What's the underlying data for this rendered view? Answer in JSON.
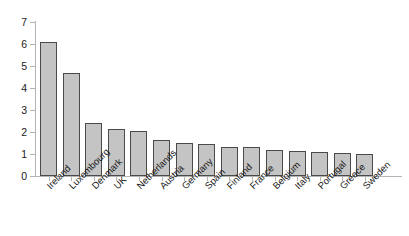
{
  "chart_data": {
    "type": "bar",
    "title": "",
    "subtitle": "",
    "xlabel": "",
    "ylabel": "",
    "ylim": [
      0,
      7
    ],
    "ytick_labels": [
      "0",
      "1",
      "2",
      "3",
      "4",
      "5",
      "6",
      "7"
    ],
    "yticks": [
      0,
      1,
      2,
      3,
      4,
      5,
      6,
      7
    ],
    "grid": false,
    "legend": false,
    "legend_position": "none",
    "categories": [
      "Ireland",
      "Luxembourg",
      "Denmark",
      "UK",
      "Netherlands",
      "Austria",
      "Germany",
      "Spain",
      "Finland",
      "France",
      "Belgium",
      "Italy",
      "Portugal",
      "Greece",
      "Sweden"
    ],
    "values": [
      6.1,
      4.7,
      2.4,
      2.15,
      2.05,
      1.65,
      1.5,
      1.45,
      1.3,
      1.3,
      1.2,
      1.15,
      1.1,
      1.05,
      1.0
    ],
    "bar_fill_color": "#c4c4c4",
    "bar_edge_color": "#4a4a4a",
    "axis_color": "#b4b4b4",
    "text_color": "#1a1a1a",
    "background_color": "#ffffff"
  }
}
